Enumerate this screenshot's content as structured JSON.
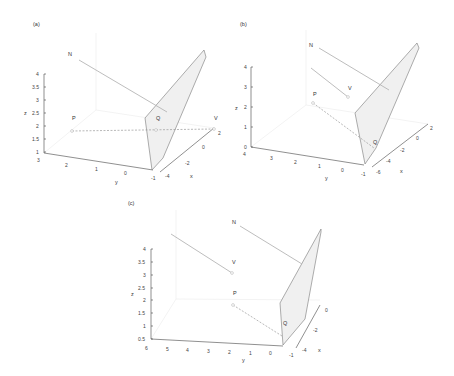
{
  "panels": [
    {
      "id": "a",
      "label": "(a)",
      "points": {
        "N": "N",
        "P": "P",
        "Q": "Q",
        "V": "V"
      },
      "axes": {
        "x_label": "x",
        "y_label": "y",
        "z_label": "z",
        "z_ticks": [
          "1",
          "1.5",
          "2",
          "2.5",
          "3",
          "3.5",
          "4"
        ],
        "y_ticks": [
          "3",
          "2",
          "1",
          "0",
          "-1"
        ],
        "x_ticks": [
          "-4",
          "-2",
          "0",
          "2"
        ]
      }
    },
    {
      "id": "b",
      "label": "(b)",
      "points": {
        "N": "N",
        "P": "P",
        "Q": "Q",
        "V": "V"
      },
      "axes": {
        "x_label": "x",
        "y_label": "y",
        "z_label": "z",
        "z_ticks": [
          "0",
          "1",
          "2",
          "3",
          "4"
        ],
        "y_ticks": [
          "4",
          "3",
          "2",
          "1",
          "0",
          "-1"
        ],
        "x_ticks": [
          "-6",
          "-4",
          "-2",
          "0",
          "2"
        ]
      }
    },
    {
      "id": "c",
      "label": "(c)",
      "points": {
        "N": "N",
        "P": "P",
        "Q": "Q",
        "V": "V"
      },
      "axes": {
        "x_label": "x",
        "y_label": "y",
        "z_label": "z",
        "z_ticks": [
          "0.5",
          "1",
          "1.5",
          "2",
          "2.5",
          "3",
          "3.5",
          "4"
        ],
        "y_ticks": [
          "6",
          "5",
          "4",
          "3",
          "2",
          "1",
          "0",
          "-1"
        ],
        "x_ticks": [
          "-4",
          "-2",
          "0"
        ]
      }
    }
  ],
  "colors": {
    "plane_fill": "#f0f0f0",
    "plane_edge": "#777777",
    "vector": "#b5b5b5",
    "axis": "#444444"
  }
}
